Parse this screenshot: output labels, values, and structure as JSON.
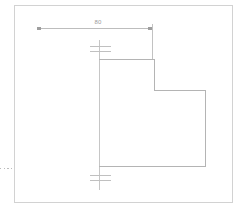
{
  "drawing": {
    "title": "CAD part outline with linear dimension",
    "background_color": "#ffffff",
    "border": {
      "name": "drawing-frame",
      "color": "#d2d2d2",
      "x": 14,
      "y": 5,
      "width": 219,
      "height": 198
    },
    "colors": {
      "outline": "#b4b4b4",
      "dimension": "#bdbdbd",
      "centerline": "#c6c6c6",
      "text": "#9a9a9a",
      "border": "#d2d2d2"
    },
    "dimensions": [
      {
        "name": "width-dimension",
        "label": "80",
        "orientation": "horizontal",
        "line_y": 28,
        "x_start": 37,
        "x_end": 152,
        "label_x": 97,
        "label_y": 20,
        "terminator": "arrow-tick",
        "extension_line": {
          "name": "extension-line-right",
          "x": 152,
          "y_start": 28,
          "y_end": 60
        }
      }
    ],
    "centerlines": [
      {
        "name": "vertical-centerline",
        "x": 99,
        "y_start": 40,
        "y_end": 190,
        "cross_marks": [
          {
            "name": "center-cross-mark-top",
            "y": 46,
            "y2": 51,
            "x_start": 90,
            "x_end": 111
          },
          {
            "name": "center-cross-mark-bottom",
            "y": 175,
            "y2": 180,
            "x_start": 90,
            "x_end": 111
          }
        ]
      }
    ],
    "profile": {
      "name": "part-outline",
      "type": "polyline-closed",
      "points": [
        [
          99,
          59
        ],
        [
          154,
          59
        ],
        [
          154,
          90
        ],
        [
          205,
          90
        ],
        [
          205,
          166
        ],
        [
          99,
          166
        ]
      ]
    },
    "leader_marks": [
      {
        "name": "dashed-edge-marker",
        "style": "dotted",
        "y": 168,
        "x_start": 0,
        "x_end": 14
      }
    ]
  }
}
